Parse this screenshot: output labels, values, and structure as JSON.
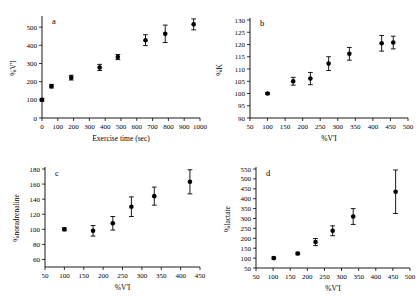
{
  "figure": {
    "background": "#ffffff",
    "marker_color": "#000000",
    "axis_color": "#000000",
    "panel_count": 4
  },
  "chart_data": [
    {
      "type": "scatter",
      "panel": "a",
      "title": "",
      "xlabel": "Exercise time (sec)",
      "ylabel": "%V'I",
      "xlim": [
        0,
        1000
      ],
      "ylim": [
        0,
        550
      ],
      "xticks": [
        0,
        100,
        200,
        300,
        400,
        500,
        600,
        700,
        800,
        900,
        1000
      ],
      "yticks": [
        0,
        100,
        200,
        300,
        400,
        500
      ],
      "grid": false,
      "legend": "none",
      "errorbars": "mean +/- SEM",
      "points": [
        {
          "x": 0,
          "y": 100,
          "err": 8
        },
        {
          "x": 60,
          "y": 175,
          "err": 10
        },
        {
          "x": 185,
          "y": 222,
          "err": 13
        },
        {
          "x": 365,
          "y": 278,
          "err": 17
        },
        {
          "x": 480,
          "y": 335,
          "err": 14
        },
        {
          "x": 655,
          "y": 428,
          "err": 30
        },
        {
          "x": 780,
          "y": 463,
          "err": 48
        },
        {
          "x": 960,
          "y": 515,
          "err": 30
        }
      ]
    },
    {
      "type": "scatter",
      "panel": "b",
      "title": "",
      "xlabel": "%V'I",
      "ylabel": "%K",
      "xlim": [
        50,
        500
      ],
      "ylim": [
        90,
        130
      ],
      "xticks": [
        50,
        100,
        150,
        200,
        250,
        300,
        350,
        400,
        450,
        500
      ],
      "yticks": [
        90,
        95,
        100,
        105,
        110,
        115,
        120,
        125,
        130
      ],
      "grid": false,
      "legend": "none",
      "errorbars": "mean +/- SEM",
      "points": [
        {
          "x": 100,
          "y": 100.0,
          "err": 0.4
        },
        {
          "x": 173,
          "y": 105.0,
          "err": 1.6
        },
        {
          "x": 222,
          "y": 106.1,
          "err": 2.5
        },
        {
          "x": 274,
          "y": 112.2,
          "err": 2.8
        },
        {
          "x": 333,
          "y": 116.2,
          "err": 2.6
        },
        {
          "x": 425,
          "y": 120.5,
          "err": 3.2
        },
        {
          "x": 458,
          "y": 120.8,
          "err": 2.6
        }
      ]
    },
    {
      "type": "scatter",
      "panel": "c",
      "title": "",
      "xlabel": "%V'I",
      "ylabel": "%noradrenaline",
      "xlim": [
        50,
        450
      ],
      "ylim": [
        50,
        180
      ],
      "xticks": [
        50,
        100,
        150,
        200,
        250,
        300,
        350,
        400,
        450
      ],
      "yticks": [
        60,
        80,
        100,
        120,
        140,
        160,
        180
      ],
      "grid": false,
      "legend": "none",
      "errorbars": "mean +/- SEM",
      "points": [
        {
          "x": 100,
          "y": 100,
          "err": 2
        },
        {
          "x": 174,
          "y": 98,
          "err": 7
        },
        {
          "x": 225,
          "y": 108,
          "err": 9
        },
        {
          "x": 273,
          "y": 130,
          "err": 13
        },
        {
          "x": 332,
          "y": 144,
          "err": 12
        },
        {
          "x": 424,
          "y": 163,
          "err": 16
        }
      ]
    },
    {
      "type": "scatter",
      "panel": "d",
      "title": "",
      "xlabel": "%V'I",
      "ylabel": "%lactate",
      "xlim": [
        50,
        500
      ],
      "ylim": [
        50,
        550
      ],
      "xticks": [
        50,
        100,
        150,
        200,
        250,
        300,
        350,
        400,
        450,
        500
      ],
      "yticks": [
        50,
        100,
        150,
        200,
        250,
        300,
        350,
        400,
        450,
        500,
        550
      ],
      "grid": false,
      "legend": "none",
      "errorbars": "mean +/- SEM",
      "points": [
        {
          "x": 102,
          "y": 100,
          "err": 5
        },
        {
          "x": 172,
          "y": 123,
          "err": 6
        },
        {
          "x": 224,
          "y": 181,
          "err": 18
        },
        {
          "x": 274,
          "y": 238,
          "err": 25
        },
        {
          "x": 334,
          "y": 310,
          "err": 40
        },
        {
          "x": 458,
          "y": 435,
          "err": 110
        }
      ]
    }
  ]
}
